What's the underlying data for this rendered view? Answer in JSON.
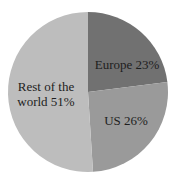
{
  "chart_data": {
    "type": "pie",
    "title": "",
    "start_angle_deg": 0,
    "direction": "clockwise",
    "slices": [
      {
        "label": "Europe",
        "value": 23,
        "display": "Europe 23%",
        "color": "#717171"
      },
      {
        "label": "US",
        "value": 26,
        "display": "US 26%",
        "color": "#9a9a9a"
      },
      {
        "label": "Rest of the world",
        "value": 51,
        "display_lines": [
          "Rest of the",
          "world 51%"
        ],
        "color": "#bdbdbd"
      }
    ],
    "legend": "none",
    "labels_inside": true
  },
  "labels": {
    "europe": "Europe 23%",
    "us": "US 26%",
    "row_line1": "Rest of the",
    "row_line2": "world 51%"
  }
}
